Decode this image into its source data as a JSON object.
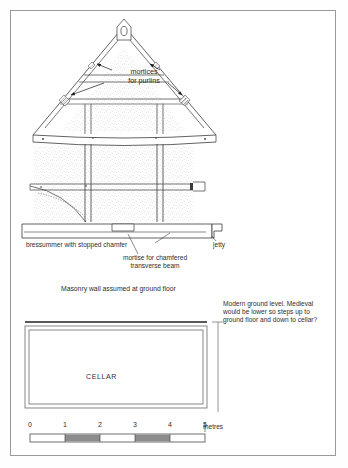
{
  "document": {
    "type": "archaeological-building-section",
    "background_color": "#ffffff",
    "border_color": "#9a9a9a",
    "ink_color": "#2e2e2e"
  },
  "annotations": {
    "mortices_for_purlins": "mortices\nfor purlins",
    "mortices_line1": "mortices",
    "mortices_line2": "for purlins",
    "bressummer": "bressummer with stopped chamfer",
    "jetty": "jetty",
    "mortise_transverse_line1": "mortise for chamfered",
    "mortise_transverse_line2": "transverse beam",
    "masonry_wall": "Masonry wall assumed at ground floor",
    "modern_ground_line1": "Modern ground level. Medieval",
    "modern_ground_line2": "would be lower so steps up to",
    "modern_ground_line3": "ground floor and down to cellar?",
    "cellar": "CELLAR"
  },
  "scale_bar": {
    "unit_label": "metres",
    "ticks": [
      "0",
      "1",
      "2",
      "3",
      "4",
      "5"
    ],
    "shaded_segments": [
      1,
      3
    ],
    "segment_count": 5,
    "bar_fill_shaded": "#8c8c8c",
    "bar_fill_plain": "#ffffff"
  },
  "chart_data": {
    "type": "table",
    "elements": [
      {
        "name": "apex-peg-hole",
        "description": "oval peg hole at roof apex"
      },
      {
        "name": "collar-beam",
        "description": "horizontal collar below apex"
      },
      {
        "name": "principal-rafters",
        "description": "pair of raking rafters forming gable"
      },
      {
        "name": "mortice-slots",
        "description": "hatched mortice slots cut in rafters for purlins"
      },
      {
        "name": "tie-beam",
        "description": "sagging tie beam across base of gable"
      },
      {
        "name": "stud-panels",
        "description": "stippled infill panels between vertical studs"
      },
      {
        "name": "curved-brace",
        "description": "curved bracket from post to bressummer"
      },
      {
        "name": "bressummer-beam",
        "description": "horizontal jettied bressummer beam"
      },
      {
        "name": "cellar-void",
        "description": "rectangular cellar below ground level"
      },
      {
        "name": "ground-level-line",
        "description": "vertical ground level indicator at right of cellar"
      }
    ]
  }
}
